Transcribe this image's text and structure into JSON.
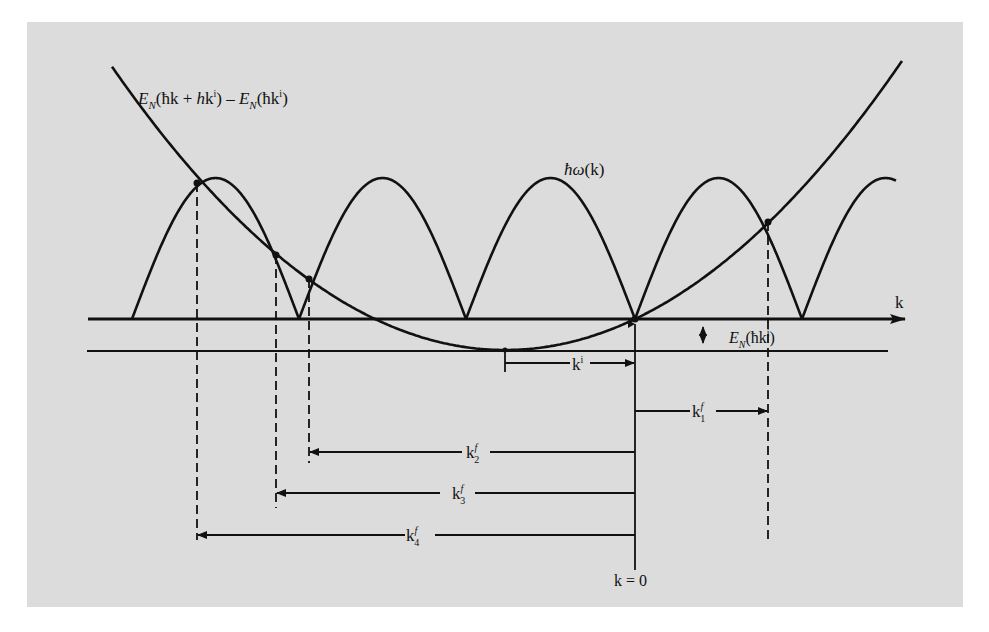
{
  "diagram": {
    "type": "physics-dispersion-diagram",
    "colors": {
      "background": "#dcdcdc",
      "ink": "#111111",
      "page": "#ffffff"
    },
    "labels": {
      "parabola_label": {
        "E": "E",
        "N": "N",
        "body1": "(ħk + ",
        "h": "h",
        "body2": "k",
        "sup": "i",
        "body3": ") – ",
        "E2": "E",
        "N2": "N",
        "body4": "(ħk",
        "sup2": "i",
        "body5": ")"
      },
      "omega_label": {
        "hbar_omega": "ħω",
        "rest": "(k)"
      },
      "axis_label": "k",
      "energy_offset_label": {
        "E": "E",
        "N": "N",
        "body": "(ħk",
        "sup": "i",
        "end": ")"
      },
      "ki_label": {
        "base": "k",
        "sup": "i"
      },
      "kf_labels": [
        {
          "base": "k",
          "sup": "f",
          "sub": "1"
        },
        {
          "base": "k",
          "sup": "f",
          "sub": "2"
        },
        {
          "base": "k",
          "sup": "f",
          "sub": "3"
        },
        {
          "base": "k",
          "sup": "f",
          "sub": "4"
        }
      ],
      "origin_label": "k = 0"
    },
    "curves": {
      "phonon_arches": "periodic arches ħω(k), zeros at reciprocal lattice points",
      "parabola": "E_N(ħk + hk^i) – E_N(ħk^i), minimum at k = −k^i"
    },
    "intersections_count": 5
  }
}
